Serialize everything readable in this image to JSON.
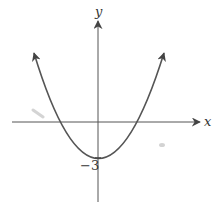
{
  "graph": {
    "x_axis_label": "x",
    "y_axis_label": "y",
    "y_intercept_label": "−3",
    "curve": "parabola opening upward",
    "colors": {
      "axis": "#555555",
      "curve": "#555555",
      "label": "#333333",
      "background": "#ffffff"
    }
  }
}
